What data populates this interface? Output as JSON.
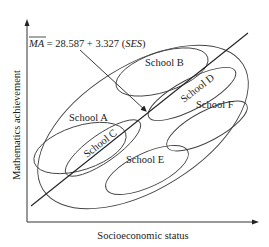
{
  "diagram": {
    "type": "multilevel-regression-schematic",
    "equation": {
      "lhs": "MA",
      "hat": true,
      "rhs_text": " = 28.587 + 3.327 (",
      "var": "SES",
      "close": ")"
    },
    "x_axis_label": "Socioeconomic status",
    "y_axis_label": "Mathematics achievement",
    "schools": [
      {
        "label": "School A"
      },
      {
        "label": "School B"
      },
      {
        "label": "School C"
      },
      {
        "label": "School D"
      },
      {
        "label": "School E"
      },
      {
        "label": "School F"
      }
    ],
    "colors": {
      "line": "#333333",
      "text": "#222222",
      "background": "#ffffff"
    }
  }
}
